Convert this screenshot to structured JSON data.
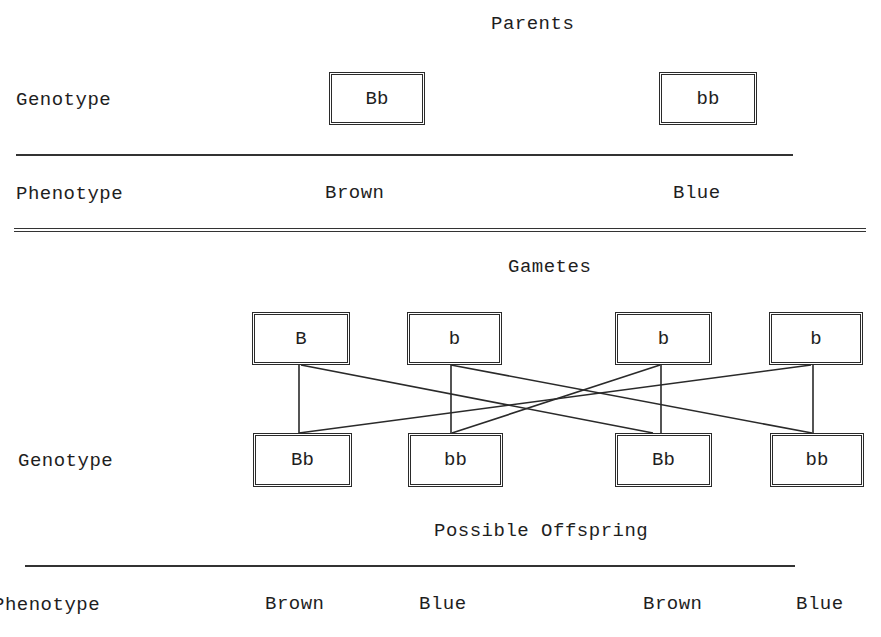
{
  "parents": {
    "title": "Parents",
    "genotype_label": "Genotype",
    "phenotype_label": "Phenotype",
    "individuals": [
      {
        "genotype": "Bb",
        "phenotype": "Brown"
      },
      {
        "genotype": "bb",
        "phenotype": "Blue"
      }
    ]
  },
  "gametes": {
    "title": "Gametes",
    "alleles": [
      "B",
      "b",
      "b",
      "b"
    ]
  },
  "offspring": {
    "title": "Possible Offspring",
    "genotype_label": "Genotype",
    "phenotype_label": "Phenotype",
    "individuals": [
      {
        "genotype": "Bb",
        "phenotype": "Brown"
      },
      {
        "genotype": "bb",
        "phenotype": "Blue"
      },
      {
        "genotype": "Bb",
        "phenotype": "Brown"
      },
      {
        "genotype": "bb",
        "phenotype": "Blue"
      }
    ]
  },
  "links": [
    {
      "from_gamete": 0,
      "to_offspring": 0
    },
    {
      "from_gamete": 0,
      "to_offspring": 2
    },
    {
      "from_gamete": 1,
      "to_offspring": 1
    },
    {
      "from_gamete": 1,
      "to_offspring": 3
    },
    {
      "from_gamete": 2,
      "to_offspring": 2
    },
    {
      "from_gamete": 2,
      "to_offspring": 1
    },
    {
      "from_gamete": 3,
      "to_offspring": 3
    },
    {
      "from_gamete": 3,
      "to_offspring": 0
    }
  ],
  "colors": {
    "ink": "#1e1e1e",
    "background": "#ffffff"
  }
}
